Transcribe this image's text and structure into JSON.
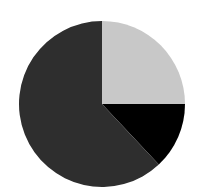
{
  "chart_data": {
    "type": "pie",
    "title": "",
    "categories": [
      "Slice A",
      "Slice B",
      "Slice C"
    ],
    "values": [
      25,
      13,
      62
    ],
    "colors": [
      "#c8c8c8",
      "#000000",
      "#2e2e2e"
    ],
    "start_angle_deg": 0,
    "direction": "clockwise",
    "legend": "none",
    "labels_shown": false
  }
}
